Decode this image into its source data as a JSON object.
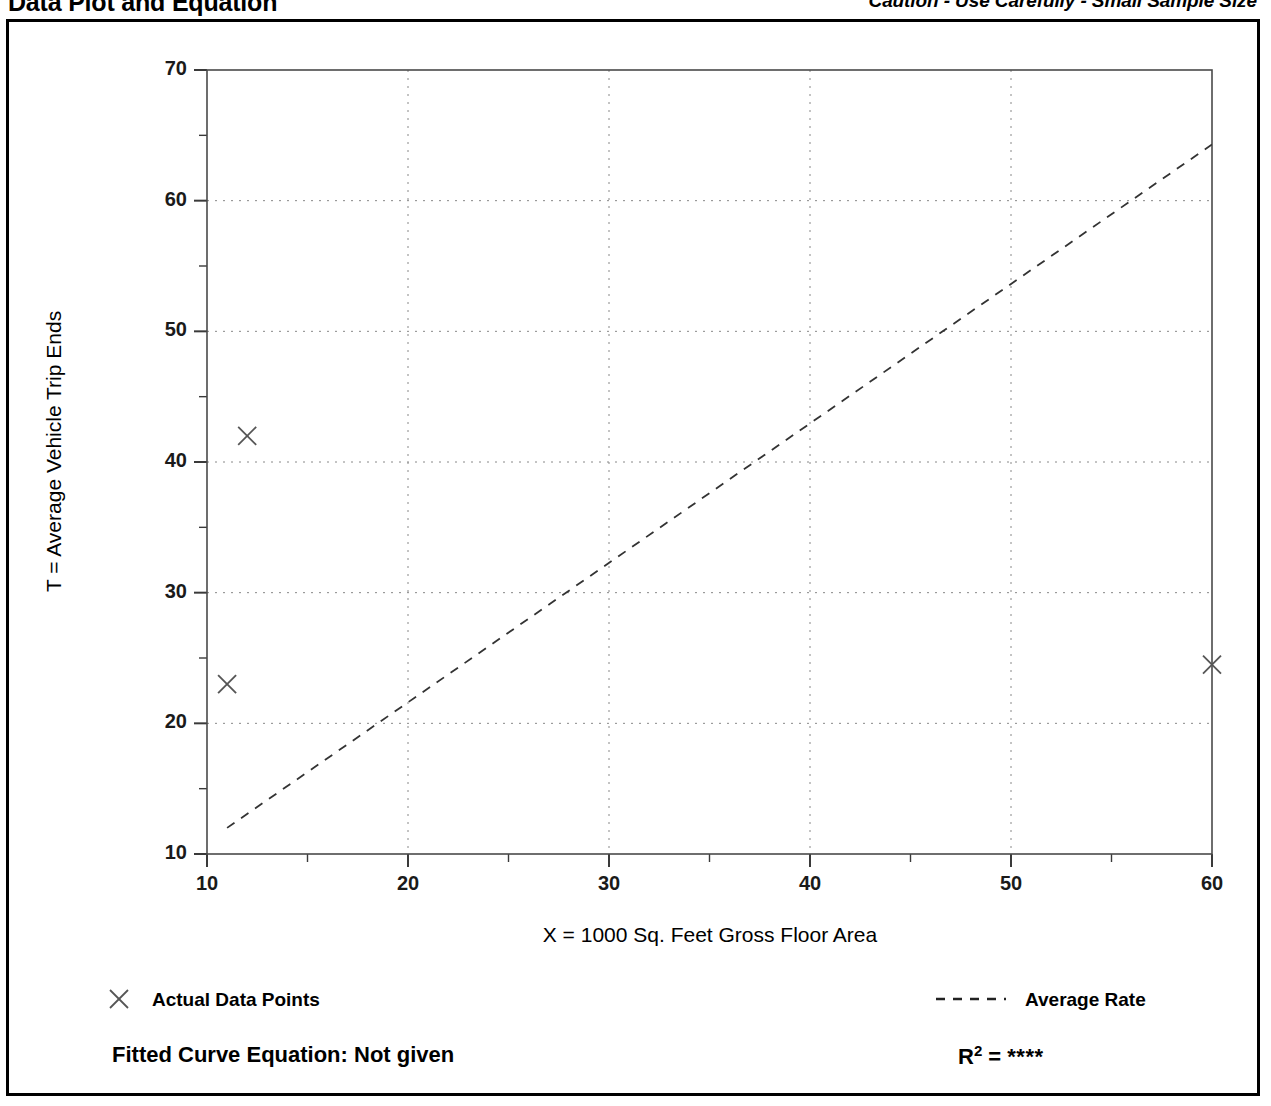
{
  "header": {
    "title": "Data Plot and Equation",
    "caution": "Caution - Use Carefully - Small Sample Size"
  },
  "footer": {
    "equation_label": "Fitted Curve Equation:  Not given",
    "rsq_label": "R",
    "rsq_exponent": "2",
    "rsq_equals": " = ",
    "rsq_value": "****"
  },
  "legend": {
    "data_points_label": "Actual Data Points",
    "average_rate_label": "Average Rate",
    "marker_icon": "x-cross-icon",
    "line_icon": "dashed-line-icon"
  },
  "chart_data": {
    "type": "scatter",
    "title": "Data Plot and Equation",
    "xlabel": "X = 1000 Sq. Feet Gross Floor Area",
    "ylabel": "T = Average Vehicle Trip Ends",
    "xlim": [
      10,
      60
    ],
    "ylim": [
      10,
      70
    ],
    "xticks": [
      10,
      20,
      30,
      40,
      50,
      60
    ],
    "yticks": [
      10,
      20,
      30,
      40,
      50,
      60,
      70
    ],
    "xminorticks": [
      15,
      25,
      35,
      45,
      55
    ],
    "yminorticks": [
      15,
      25,
      35,
      45,
      55,
      65
    ],
    "grid": true,
    "grid_style": "dotted",
    "legend_position": "below-axes",
    "series": [
      {
        "name": "Actual Data Points",
        "type": "scatter",
        "marker": "x",
        "color": "#555555",
        "points": [
          {
            "x": 11.0,
            "y": 23.0
          },
          {
            "x": 12.0,
            "y": 42.0
          },
          {
            "x": 60.0,
            "y": 24.5
          }
        ]
      },
      {
        "name": "Average Rate",
        "type": "line",
        "style": "dashed",
        "color": "#333333",
        "points": [
          {
            "x": 11.0,
            "y": 12.0
          },
          {
            "x": 60.0,
            "y": 64.3
          }
        ]
      }
    ],
    "annotations": [
      "Caution - Use Carefully - Small Sample Size",
      "Fitted Curve Equation:  Not given",
      "R2 = ****"
    ]
  }
}
